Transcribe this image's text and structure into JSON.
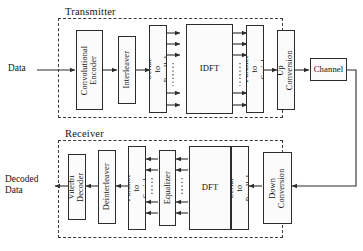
{
  "figure": {
    "background": "#ffffff",
    "line_color": "#2c2c2c",
    "dash_color": "#3a3a3a"
  },
  "sections": {
    "transmitter": {
      "label": "Transmitter"
    },
    "receiver": {
      "label": "Receiver"
    }
  },
  "io_labels": {
    "input": "Data",
    "output": "Decoded\nData"
  },
  "transmitter_blocks": [
    {
      "id": "conv-encoder",
      "label": "Convolutional\nEncoder",
      "orientation": "vertical"
    },
    {
      "id": "interleaver",
      "label": "Interleaver",
      "orientation": "vertical"
    },
    {
      "id": "serial-to-parallel",
      "label": "Serial to Parallel",
      "orientation": "vertical"
    },
    {
      "id": "idft",
      "label": "IDFT",
      "orientation": "horizontal"
    },
    {
      "id": "parallel-to-serial",
      "label": "Parallel to Serial",
      "orientation": "vertical"
    },
    {
      "id": "up-conversion",
      "label": "Up Conversion",
      "orientation": "vertical"
    }
  ],
  "channel_block": {
    "id": "channel",
    "label": "Channel",
    "orientation": "horizontal"
  },
  "receiver_blocks": [
    {
      "id": "viterbi-decoder",
      "label": "Viterbi\nDecoder",
      "orientation": "vertical"
    },
    {
      "id": "deinterleaver",
      "label": "Deinterleaver",
      "orientation": "vertical"
    },
    {
      "id": "parallel-to-serial-rx",
      "label": "Parallel to Serial",
      "orientation": "vertical"
    },
    {
      "id": "equalizer",
      "label": "Equalizer",
      "orientation": "vertical"
    },
    {
      "id": "dft",
      "label": "DFT",
      "orientation": "horizontal"
    },
    {
      "id": "serial-to-parallel-rx",
      "label": "Serial to Parallel",
      "orientation": "vertical"
    },
    {
      "id": "down-conversion",
      "label": "Down\nConversion",
      "orientation": "vertical"
    }
  ],
  "bus_notes": {
    "parallel_lines_top": 3,
    "parallel_lines_bottom": 2,
    "ellipsis": "vertical dotted"
  }
}
